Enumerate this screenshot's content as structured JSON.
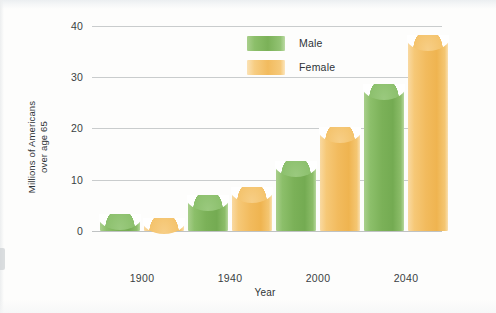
{
  "chart_data": {
    "type": "bar",
    "title": "",
    "xlabel": "Year",
    "ylabel_line1": "Millions of Americans",
    "ylabel_line2": "over age 65",
    "categories": [
      "1900",
      "1940",
      "2000",
      "2040"
    ],
    "series": [
      {
        "name": "Male",
        "color": "#7bb158",
        "values": [
          3.1,
          6.9,
          13.5,
          28.5
        ]
      },
      {
        "name": "Female",
        "color": "#f2bb5e",
        "values": [
          2.3,
          8.4,
          20.0,
          38.0
        ]
      }
    ],
    "yticks": [
      "0",
      "10",
      "20",
      "30",
      "40"
    ],
    "ylim": [
      0,
      42
    ],
    "grid": true,
    "legend_position": "top-center"
  },
  "legend": {
    "items": [
      {
        "label": "Male",
        "swatch": "male-swatch"
      },
      {
        "label": "Female",
        "swatch": "female-swatch"
      }
    ]
  },
  "axes": {
    "y_label_line1": "Millions of Americans",
    "y_label_line2": "over age 65",
    "x_label": "Year",
    "y_ticks": [
      "40",
      "30",
      "20",
      "10",
      "0"
    ],
    "x_ticks": [
      "1900",
      "1940",
      "2000",
      "2040"
    ]
  },
  "colors": {
    "male": "#7bb158",
    "female": "#f2bb5e",
    "gridline": "#c9cccd",
    "text": "#2f3438",
    "background": "#fdfdfc"
  }
}
